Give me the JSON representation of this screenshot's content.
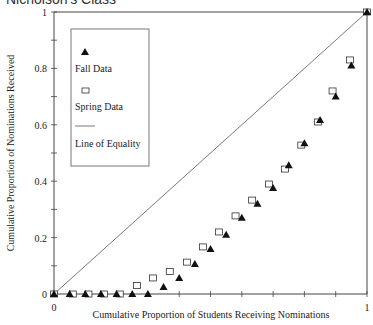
{
  "chart_data": {
    "type": "scatter",
    "title": "Nicholson's Class",
    "xlabel": "Cumulative Proportion of Students Receiving Nominations",
    "ylabel": "Cumulative Proportion of Nominations Received",
    "xlim": [
      0,
      1
    ],
    "ylim": [
      0,
      1
    ],
    "x_tick_labels": [
      "0",
      "1"
    ],
    "y_tick_labels": [
      "0",
      "0.2",
      "0.4",
      "0.6",
      "0.8",
      "1"
    ],
    "grid": false,
    "legend_position": "upper-left",
    "series": [
      {
        "name": "Fall Data",
        "marker": "filled-triangle",
        "points": [
          [
            0.0,
            0.0
          ],
          [
            0.05,
            0.0
          ],
          [
            0.1,
            0.0
          ],
          [
            0.15,
            0.0
          ],
          [
            0.2,
            0.0
          ],
          [
            0.25,
            0.0
          ],
          [
            0.3,
            0.0
          ],
          [
            0.35,
            0.025
          ],
          [
            0.4,
            0.057
          ],
          [
            0.45,
            0.106
          ],
          [
            0.5,
            0.16
          ],
          [
            0.55,
            0.21
          ],
          [
            0.6,
            0.27
          ],
          [
            0.65,
            0.32
          ],
          [
            0.7,
            0.376
          ],
          [
            0.75,
            0.457
          ],
          [
            0.8,
            0.535
          ],
          [
            0.85,
            0.617
          ],
          [
            0.9,
            0.7
          ],
          [
            0.95,
            0.81
          ],
          [
            1.0,
            1.0
          ]
        ]
      },
      {
        "name": "Spring Data",
        "marker": "open-square",
        "points": [
          [
            0.0,
            0.0
          ],
          [
            0.06,
            0.0
          ],
          [
            0.11,
            0.0
          ],
          [
            0.16,
            0.0
          ],
          [
            0.21,
            0.0
          ],
          [
            0.265,
            0.03
          ],
          [
            0.316,
            0.057
          ],
          [
            0.37,
            0.08
          ],
          [
            0.425,
            0.113
          ],
          [
            0.476,
            0.167
          ],
          [
            0.527,
            0.22
          ],
          [
            0.58,
            0.277
          ],
          [
            0.633,
            0.333
          ],
          [
            0.687,
            0.39
          ],
          [
            0.738,
            0.443
          ],
          [
            0.79,
            0.528
          ],
          [
            0.843,
            0.61
          ],
          [
            0.89,
            0.72
          ],
          [
            0.946,
            0.83
          ],
          [
            1.0,
            1.0
          ]
        ]
      },
      {
        "name": "Line of Equality",
        "marker": "line",
        "points": [
          [
            0,
            0
          ],
          [
            1,
            1
          ]
        ]
      }
    ]
  },
  "legend": {
    "items": [
      {
        "label": "Fall Data",
        "symbol": "triangle"
      },
      {
        "label": "Spring Data",
        "symbol": "square"
      },
      {
        "label": "Line of Equality",
        "symbol": "line"
      }
    ]
  },
  "colors": {
    "axis": "#444444",
    "marker": "#111111",
    "line": "#555555",
    "legend_border": "#777777"
  }
}
